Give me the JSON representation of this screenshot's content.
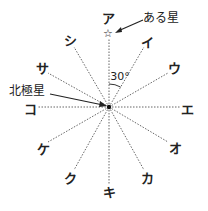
{
  "diagram": {
    "center": {
      "x": 109,
      "y": 107
    },
    "directions": [
      {
        "label": "ア",
        "angle_deg": 0,
        "x": 108,
        "y": 18
      },
      {
        "label": "イ",
        "angle_deg": 30,
        "x": 147,
        "y": 42
      },
      {
        "label": "ウ",
        "angle_deg": 60,
        "x": 174,
        "y": 68
      },
      {
        "label": "エ",
        "angle_deg": 90,
        "x": 187,
        "y": 109
      },
      {
        "label": "オ",
        "angle_deg": 120,
        "x": 175,
        "y": 148
      },
      {
        "label": "カ",
        "angle_deg": 150,
        "x": 147,
        "y": 178
      },
      {
        "label": "キ",
        "angle_deg": 180,
        "x": 109,
        "y": 192
      },
      {
        "label": "ク",
        "angle_deg": 210,
        "x": 70,
        "y": 178
      },
      {
        "label": "ケ",
        "angle_deg": 240,
        "x": 43,
        "y": 149
      },
      {
        "label": "コ",
        "angle_deg": 270,
        "x": 30,
        "y": 109
      },
      {
        "label": "サ",
        "angle_deg": 300,
        "x": 42,
        "y": 68
      },
      {
        "label": "シ",
        "angle_deg": 330,
        "x": 70,
        "y": 40
      }
    ],
    "annotations": {
      "star_label": "ある星",
      "polaris_label": "北極星",
      "angle_label": "30°",
      "star_symbol": "☆"
    }
  }
}
